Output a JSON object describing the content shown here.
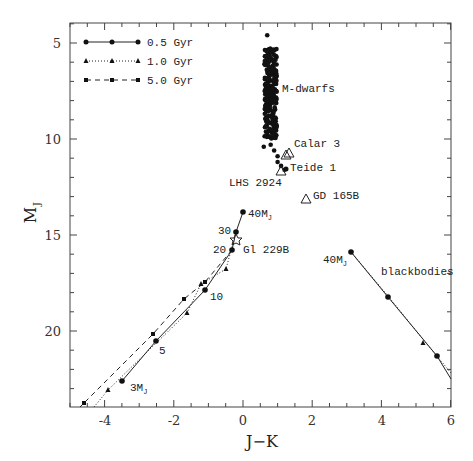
{
  "chart_data": {
    "type": "scatter",
    "title": "",
    "xlabel": "J−K",
    "ylabel": "M_J",
    "xlim": [
      -5,
      6
    ],
    "ylim": [
      24,
      4
    ],
    "y_inverted": true,
    "grid": false,
    "x_ticks": [
      -4,
      -2,
      0,
      2,
      4,
      6
    ],
    "y_ticks": [
      5,
      10,
      15,
      20
    ],
    "legend": {
      "position": "upper-left",
      "entries": [
        {
          "label": "0.5 Gyr",
          "line": "solid",
          "marker": "circle"
        },
        {
          "label": "1.0 Gyr",
          "line": "dotted",
          "marker": "triangle"
        },
        {
          "label": "5.0 Gyr",
          "line": "dashed",
          "marker": "square"
        }
      ]
    },
    "series": [
      {
        "name": "0.5 Gyr",
        "style": "solid",
        "marker": "circle",
        "x": [
          0.0,
          -0.2,
          -0.3,
          -1.1,
          -2.5,
          -3.5
        ],
        "y": [
          13.8,
          14.9,
          15.8,
          17.9,
          20.6,
          22.7
        ],
        "point_labels": [
          "40M_J",
          "30",
          "20",
          "10",
          "5",
          "3M_J"
        ]
      },
      {
        "name": "1.0 Gyr",
        "style": "dotted",
        "marker": "triangle",
        "x": [
          -0.2,
          -0.5,
          -1.2,
          -1.6,
          -3.9,
          -4.3
        ],
        "y": [
          14.9,
          16.9,
          17.6,
          19.2,
          23.2,
          24.0
        ]
      },
      {
        "name": "5.0 Gyr",
        "style": "dashed",
        "marker": "square",
        "x": [
          -0.3,
          -1.1,
          -1.7,
          -2.6,
          -4.6,
          -4.7
        ],
        "y": [
          15.8,
          17.5,
          18.4,
          20.2,
          23.8,
          24.0
        ]
      },
      {
        "name": "blackbodies 0.5 Gyr",
        "style": "solid",
        "marker": "circle",
        "x": [
          3.1,
          4.2,
          5.6,
          6.0
        ],
        "y": [
          15.9,
          18.2,
          21.3,
          22.5
        ],
        "point_labels": [
          "40M_J",
          "",
          "",
          ""
        ]
      },
      {
        "name": "blackbodies 1.0/5.0 Gyr",
        "style": "dotted",
        "marker": "triangle",
        "x": [
          4.2,
          5.3,
          6.0
        ],
        "y": [
          18.1,
          20.6,
          22.2
        ]
      },
      {
        "name": "M-dwarfs",
        "style": "none",
        "marker": "filled-circle",
        "x_range": [
          0.6,
          1.2
        ],
        "y_range": [
          4.5,
          11.8
        ],
        "description": "dense vertical band of filled points near J−K≈0.8, M_J 4.5–11.8"
      }
    ],
    "objects": [
      {
        "name": "Calar 3",
        "marker": "open-triangle",
        "x": 1.3,
        "y": 10.8
      },
      {
        "name": "Teide 1",
        "marker": "open-triangle",
        "x": 1.1,
        "y": 11.7
      },
      {
        "name": "LHS 2924",
        "marker": "filled-circle",
        "x": 1.2,
        "y": 11.6
      },
      {
        "name": "GD 165B",
        "marker": "open-triangle",
        "x": 1.8,
        "y": 13.2
      },
      {
        "name": "Gl 229B",
        "marker": "open-star",
        "x": -0.2,
        "y": 15.4
      }
    ],
    "annotations": [
      "M-dwarfs",
      "blackbodies",
      "40M_J",
      "3M_J",
      "30",
      "20",
      "10",
      "5",
      "Calar 3",
      "Teide 1",
      "LHS 2924",
      "GD 165B",
      "Gl 229B"
    ]
  },
  "labels": {
    "xlabel": "J−K",
    "ylabel_main": "M",
    "ylabel_sub": "J",
    "legend": [
      "0.5 Gyr",
      "1.0 Gyr",
      "5.0 Gyr"
    ],
    "mdwarfs": "M-dwarfs",
    "blackbodies": "blackbodies",
    "calar": "Calar 3",
    "teide": "Teide 1",
    "lhs": "LHS 2924",
    "gd": "GD 165B",
    "gl": "Gl 229B",
    "m40": "40M",
    "m40_bb": "40M",
    "m3": "3M",
    "mj_sub": "J",
    "m30": "30",
    "m20": "20",
    "m10": "10",
    "m5": "5"
  },
  "ticks": {
    "x": [
      "-4",
      "-2",
      "0",
      "2",
      "4",
      "6"
    ],
    "y": [
      "5",
      "10",
      "15",
      "20"
    ]
  }
}
